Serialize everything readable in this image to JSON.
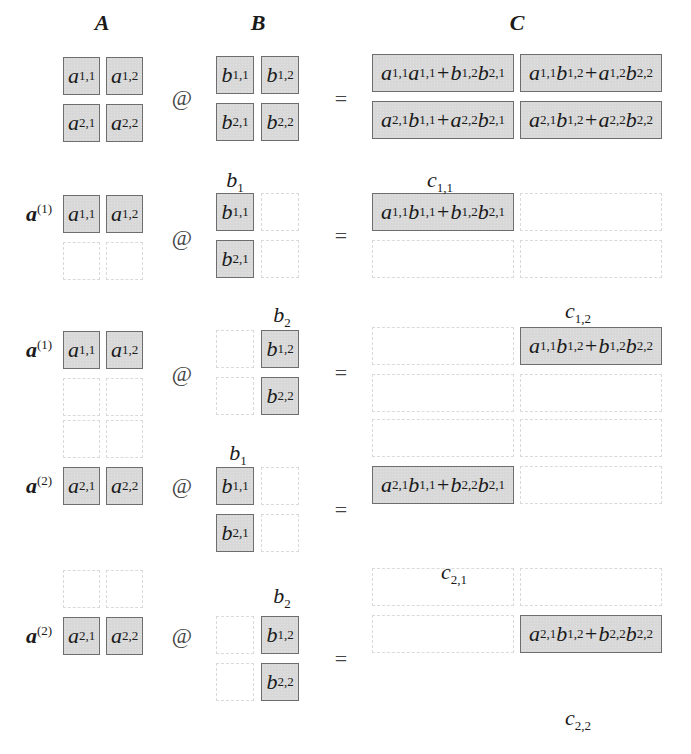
{
  "headers": {
    "A": "A",
    "B": "B",
    "C": "C"
  },
  "operators": {
    "matmul": "@",
    "equals": "="
  },
  "full": {
    "A": [
      "a|1,1",
      "a|1,2",
      "a|2,1",
      "a|2,2"
    ],
    "B": [
      "b|1,1",
      "b|1,2",
      "b|2,1",
      "b|2,2"
    ],
    "C": [
      "a|1,1|a|1,1|+|b|1,2|b|2,1",
      "a|1,1|b|1,2|+|a|1,2|b|2,2",
      "a|2,1|b|1,1|+|a|2,2|b|2,1",
      "a|2,1|b|1,2|+|a|2,2|b|2,2"
    ]
  },
  "steps": [
    {
      "row_label": {
        "base": "a",
        "sup": "(1)"
      },
      "col_label": {
        "base": "b",
        "sub": "1"
      },
      "out_label": {
        "base": "c",
        "sub": "1,1"
      },
      "A": [
        "a|1,1",
        "a|1,2"
      ],
      "B": [
        "b|1,1",
        "b|2,1"
      ],
      "C": "a|1,1|b|1,1|+|b|1,2|b|2,1"
    },
    {
      "row_label": {
        "base": "a",
        "sup": "(1)"
      },
      "col_label": {
        "base": "b",
        "sub": "2"
      },
      "out_label": {
        "base": "c",
        "sub": "1,2"
      },
      "A": [
        "a|1,1",
        "a|1,2"
      ],
      "B": [
        "b|1,2",
        "b|2,2"
      ],
      "C": "a|1,1|b|1,2|+|b|1,2|b|2,2"
    },
    {
      "row_label": {
        "base": "a",
        "sup": "(2)"
      },
      "col_label": {
        "base": "b",
        "sub": "1"
      },
      "out_label": {
        "base": "c",
        "sub": "2,1"
      },
      "A": [
        "a|2,1",
        "a|2,2"
      ],
      "B": [
        "b|1,1",
        "b|2,1"
      ],
      "C": "a|2,1|b|1,1|+|b|2,2|b|2,1"
    },
    {
      "row_label": {
        "base": "a",
        "sup": "(2)"
      },
      "col_label": {
        "base": "b",
        "sub": "2"
      },
      "out_label": {
        "base": "c",
        "sub": "2,2"
      },
      "A": [
        "a|2,1",
        "a|2,2"
      ],
      "B": [
        "b|1,2",
        "b|2,2"
      ],
      "C": "a|2,1|b|1,2|+|b|2,2|b|2,2"
    }
  ],
  "colors": {
    "cell_fill": "#d8d8d8",
    "cell_border": "#6e6e6e",
    "empty_border": "#dadada"
  }
}
